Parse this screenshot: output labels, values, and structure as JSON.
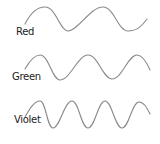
{
  "diagram": {
    "title": "",
    "stroke_color": "#8a8a8a",
    "waves": [
      {
        "label": "Red",
        "path": "M25,24 C30,14 36,7 45,7 C56,7 60,31 68,31 C78,31 90,7 103,7 C114,7 118,31 128,31 C137,31 142,26 147,19"
      },
      {
        "label": "Green",
        "path": "M25,69 C29,62 34,55 40,55 C49,55 52,80 60,80 C70,80 78,55 88,55 C98,55 103,79 112,79 C122,79 128,55 137,55 C143,55 147,63 150,70"
      },
      {
        "label": "Violet",
        "path": "M25,117 C29,110 34,101 40,101 C46,101 47,128 53,128 C60,128 64,101 72,101 C79,101 81,128 88,128 C95,128 98,101 105,101 C112,101 115,128 122,128 C129,128 132,102 139,102 C144,102 147,108 150,114"
      }
    ]
  }
}
